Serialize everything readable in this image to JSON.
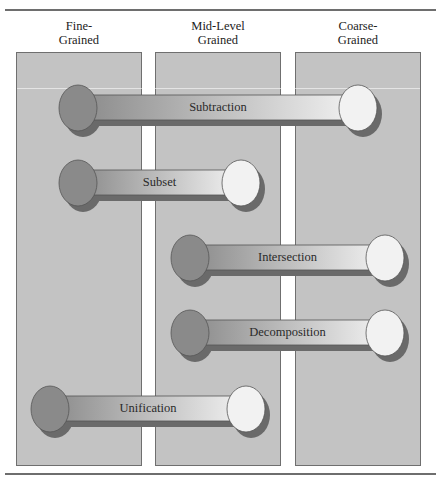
{
  "columns": [
    {
      "line1": "Fine-",
      "line2": "Grained"
    },
    {
      "line1": "Mid-Level",
      "line2": "Grained"
    },
    {
      "line1": "Coarse-",
      "line2": "Grained"
    }
  ],
  "bones": [
    {
      "label": "Subtraction",
      "from": "Fine-Grained",
      "to": "Coarse-Grained"
    },
    {
      "label": "Subset",
      "from": "Fine-Grained",
      "to": "Mid-Level Grained"
    },
    {
      "label": "Intersection",
      "from": "Mid-Level Grained",
      "to": "Coarse-Grained"
    },
    {
      "label": "Decomposition",
      "from": "Mid-Level Grained",
      "to": "Coarse-Grained"
    },
    {
      "label": "Unification",
      "from": "Fine-Grained",
      "to": "Mid-Level Grained"
    }
  ],
  "colors": {
    "column_fill": "#c3c3c3",
    "left_knob": "#8a8a8a",
    "right_knob": "#f2f2f2",
    "shadow": "#6a6a6a",
    "rule": "#6e6e6e"
  }
}
